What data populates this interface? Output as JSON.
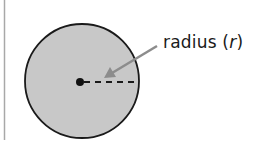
{
  "diagram": {
    "type": "circle-radius",
    "label": {
      "prefix": "radius (",
      "variable": "r",
      "suffix": ")"
    },
    "colors": {
      "fill": "#c8c8c8",
      "stroke": "#1a1a1a",
      "arrow": "#8c8c8c",
      "border": "#a8a8a8"
    }
  }
}
